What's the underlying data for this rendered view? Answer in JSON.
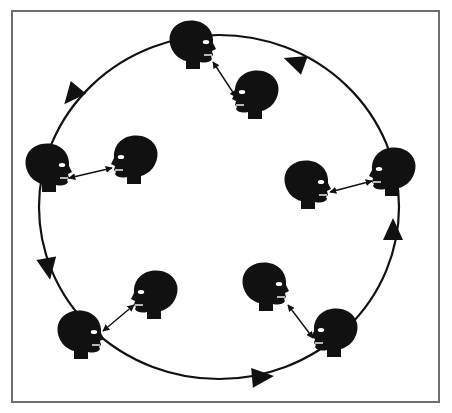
{
  "diagram": {
    "colors": {
      "ink": "#111111",
      "frame": "#6e6e6e",
      "background": "#ffffff"
    },
    "loop": {
      "cx": 219,
      "cy": 207,
      "rx": 180,
      "ry": 172,
      "direction": "counter-clockwise"
    },
    "loop_arrows": [
      {
        "x": 295,
        "y": 62,
        "angle": 200
      },
      {
        "x": 72,
        "y": 95,
        "angle": 130
      },
      {
        "x": 48,
        "y": 268,
        "angle": 80
      },
      {
        "x": 262,
        "y": 377,
        "angle": -5
      },
      {
        "x": 393,
        "y": 230,
        "angle": -90
      }
    ],
    "pairs": [
      {
        "name": "top",
        "outer": {
          "x": 192,
          "y": 45,
          "facing": "right"
        },
        "inner": {
          "x": 256,
          "y": 95,
          "facing": "left"
        },
        "link": [
          [
            213,
            62
          ],
          [
            236,
            97
          ]
        ]
      },
      {
        "name": "left",
        "outer": {
          "x": 48,
          "y": 168,
          "facing": "right"
        },
        "inner": {
          "x": 135,
          "y": 160,
          "facing": "left"
        },
        "link": [
          [
            69,
            178
          ],
          [
            112,
            168
          ]
        ]
      },
      {
        "name": "right",
        "outer": {
          "x": 393,
          "y": 172,
          "facing": "left"
        },
        "inner": {
          "x": 307,
          "y": 185,
          "facing": "right"
        },
        "link": [
          [
            330,
            192
          ],
          [
            372,
            181
          ]
        ]
      },
      {
        "name": "bottom-left",
        "outer": {
          "x": 80,
          "y": 335,
          "facing": "right"
        },
        "inner": {
          "x": 155,
          "y": 295,
          "facing": "left"
        },
        "link": [
          [
            103,
            331
          ],
          [
            134,
            305
          ]
        ]
      },
      {
        "name": "bottom-right",
        "outer": {
          "x": 335,
          "y": 333,
          "facing": "left"
        },
        "inner": {
          "x": 265,
          "y": 287,
          "facing": "right"
        },
        "link": [
          [
            288,
            305
          ],
          [
            313,
            338
          ]
        ]
      }
    ]
  }
}
